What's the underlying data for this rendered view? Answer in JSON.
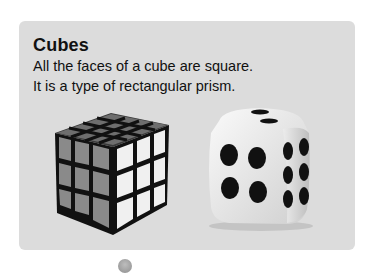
{
  "card": {
    "title": "Cubes",
    "lines": [
      "All the faces of a cube are square.",
      "It is a type of rectangular prism."
    ],
    "images": [
      {
        "name": "rubiks-cube",
        "description": "4x4 puzzle cube"
      },
      {
        "name": "die",
        "description": "six-sided die showing four and six"
      }
    ]
  },
  "colors": {
    "card_bg": "#dcdcdc",
    "text": "#111111",
    "page_bg": "#ffffff"
  }
}
